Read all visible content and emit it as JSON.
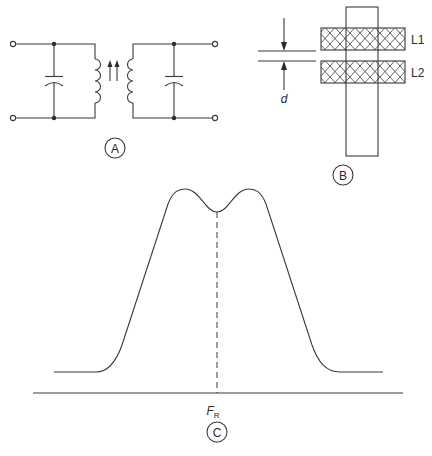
{
  "figure": {
    "panels": [
      {
        "id": "A",
        "label": "A",
        "description": "Two parallel LC tuned circuits coupled by a pair of inductors with tuning slugs (arrows)"
      },
      {
        "id": "B",
        "label": "B",
        "description": "Two coils L1 and L2 wound on a common form separated by distance d"
      },
      {
        "id": "C",
        "label": "C",
        "description": "Overcoupled double-tuned response curve with double hump centered at FR"
      }
    ],
    "panel_b": {
      "coil_top_label": "L1",
      "coil_bottom_label": "L2",
      "spacing_label": "d"
    },
    "panel_c": {
      "center_label_main": "F",
      "center_label_sub": "R"
    }
  },
  "colors": {
    "stroke": "#3a3a3a",
    "background": "#ffffff"
  }
}
